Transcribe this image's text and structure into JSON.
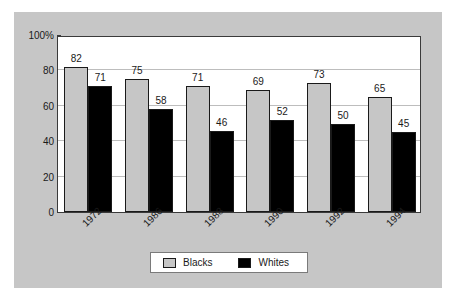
{
  "chart_data": {
    "type": "bar",
    "title": "",
    "xlabel": "",
    "ylabel": "",
    "categories": [
      "1972",
      "1986",
      "1988",
      "1990",
      "1992",
      "1994"
    ],
    "series": [
      {
        "name": "Blacks",
        "color": "#c6c6c6",
        "values": [
          82,
          75,
          71,
          69,
          73,
          65
        ]
      },
      {
        "name": "Whites",
        "color": "#000000",
        "values": [
          71,
          58,
          46,
          52,
          50,
          45
        ]
      }
    ],
    "ylim": [
      0,
      100
    ],
    "yticks": [
      0,
      20,
      40,
      60,
      80,
      100
    ],
    "ytick_labels": [
      "0",
      "20",
      "40",
      "60",
      "80",
      "100%"
    ],
    "grid": true,
    "legend_position": "bottom-center",
    "background_color": "#c6c6c6",
    "plot_background_color": "#ffffff",
    "gridline_color": "#bdbdbd",
    "axis_color": "#3a3a3a",
    "data_labels_shown": true
  }
}
